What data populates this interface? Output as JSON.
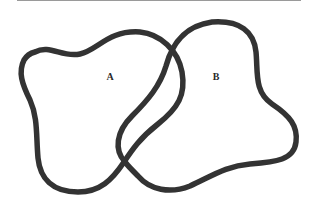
{
  "diagram": {
    "type": "set-diagram",
    "sets": [
      {
        "label": "A"
      },
      {
        "label": "B"
      }
    ],
    "stroke_color": "#333333",
    "background": "#ffffff"
  }
}
